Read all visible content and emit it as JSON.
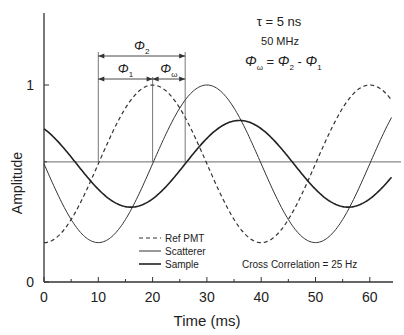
{
  "chart_data": {
    "type": "line",
    "title": "",
    "xlabel": "Time (ms)",
    "ylabel": "Amplitude",
    "xlim": [
      0,
      65
    ],
    "ylim": [
      0,
      1.35
    ],
    "x_ticks": [
      0,
      10,
      20,
      30,
      40,
      50,
      60
    ],
    "x_tick_labels": [
      "0",
      "10",
      "20",
      "30",
      "40",
      "50",
      "60"
    ],
    "x_minor_ticks": [
      5,
      15,
      25,
      35,
      45,
      55
    ],
    "y_ticks": [
      0,
      1
    ],
    "y_tick_labels": [
      "0",
      "1"
    ],
    "y_minor_ticks": [
      0.2,
      0.61
    ],
    "grid": false,
    "reference_line": {
      "y": 0.61,
      "color": "#888888"
    },
    "series": [
      {
        "name": "Ref PMT",
        "style": "dashed",
        "width": 1.2,
        "color": "#333333",
        "model": {
          "offset": 0.6,
          "amplitude": 0.4,
          "period_ms": 40,
          "peak_ms": 20
        },
        "x": [
          0,
          5,
          10,
          15,
          20,
          25,
          30,
          35,
          40,
          45,
          50,
          55,
          60,
          64
        ],
        "values": [
          0.2,
          0.26,
          0.4,
          0.77,
          1.0,
          0.88,
          0.6,
          0.32,
          0.2,
          0.32,
          0.6,
          0.88,
          1.0,
          0.92
        ]
      },
      {
        "name": "Scatterer",
        "style": "solid",
        "width": 1.0,
        "color": "#333333",
        "model": {
          "offset": 0.6,
          "amplitude": 0.4,
          "period_ms": 40,
          "peak_ms": 30
        },
        "x": [
          0,
          5,
          10,
          15,
          20,
          25,
          30,
          35,
          40,
          45,
          50,
          55,
          60,
          64
        ],
        "values": [
          0.6,
          0.32,
          0.2,
          0.32,
          0.6,
          0.88,
          1.0,
          0.88,
          0.6,
          0.32,
          0.2,
          0.32,
          0.6,
          0.84
        ]
      },
      {
        "name": "Sample",
        "style": "solid",
        "width": 1.6,
        "color": "#222222",
        "model": {
          "offset": 0.6,
          "amplitude": 0.22,
          "period_ms": 40,
          "peak_ms": 36
        },
        "x": [
          0,
          5,
          10,
          15,
          20,
          25,
          30,
          35,
          40,
          45,
          50,
          55,
          60,
          64
        ],
        "values": [
          0.78,
          0.68,
          0.5,
          0.39,
          0.42,
          0.54,
          0.73,
          0.82,
          0.78,
          0.68,
          0.5,
          0.39,
          0.42,
          0.53
        ]
      }
    ],
    "legend": {
      "position": "lower-left-inside",
      "entries": [
        "Ref PMT",
        "Scatterer",
        "Sample"
      ]
    },
    "annotations": {
      "tau": "τ  =  5 ns",
      "frequency": "50 MHz",
      "phase_relation": {
        "lhs": "Φ",
        "lhs_sub": "ω",
        "eq": " = ",
        "a": "Φ",
        "a_sub": "2",
        "minus": " - ",
        "b": "Φ",
        "b_sub": "1"
      },
      "cross_correlation": "Cross Correlation = 25 Hz",
      "phi2": {
        "label": "Φ",
        "sub": "2",
        "from_ms": 10,
        "to_ms": 26
      },
      "phi1": {
        "label": "Φ",
        "sub": "1",
        "from_ms": 10,
        "to_ms": 20
      },
      "phi_omega": {
        "label": "Φ",
        "sub": "ω",
        "from_ms": 20,
        "to_ms": 26
      }
    }
  }
}
